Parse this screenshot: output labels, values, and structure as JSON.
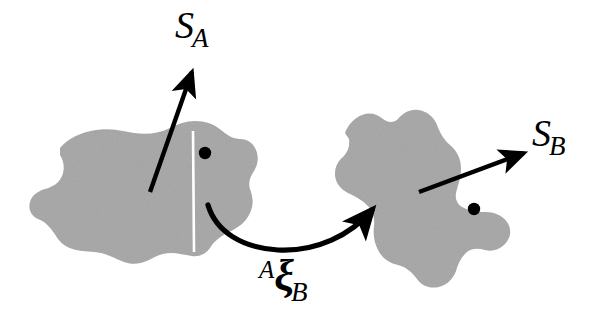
{
  "figure": {
    "background_color": "#ffffff",
    "blob_fill_color": "#ababab",
    "stroke_color": "#000000",
    "cut_line_color": "#ffffff",
    "width": 613,
    "height": 332
  },
  "labels": {
    "surface_a": {
      "base": "S",
      "sub": "A"
    },
    "surface_b": {
      "base": "S",
      "sub": "B"
    },
    "transform": {
      "presup": "A",
      "glyph": "ξ",
      "sub": "B"
    }
  },
  "shapes": {
    "left_body": {
      "name": "body-A",
      "marker_dot": {
        "cx": 205,
        "cy": 153,
        "r": 6
      },
      "cut_line": {
        "x1": 193,
        "y1": 135,
        "x2": 194,
        "y2": 250
      }
    },
    "right_body": {
      "name": "body-B",
      "marker_dot": {
        "cx": 474,
        "cy": 209,
        "r": 6
      }
    }
  },
  "arrows": {
    "normal_a": {
      "from": [
        150,
        192
      ],
      "to": [
        194,
        64
      ]
    },
    "normal_b": {
      "from": [
        419,
        192
      ],
      "to": [
        530,
        151
      ]
    },
    "transform_arc": {
      "from": [
        208,
        205
      ],
      "to": [
        379,
        203
      ]
    }
  }
}
